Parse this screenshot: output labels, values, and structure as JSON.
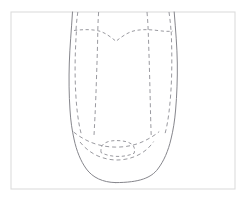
{
  "figure": {
    "background_color": "#ffffff",
    "canvas": {
      "width": 246,
      "height": 201
    }
  },
  "frame": {
    "name": "image-border-frame",
    "x": 11,
    "y": 12,
    "width": 224,
    "height": 177,
    "stroke_color": "#dcdcdc",
    "stroke_width": 1.1,
    "fill_color": "#ffffff"
  },
  "style": {
    "solid_stroke_color": "#86868c",
    "solid_stroke_width": 1.0,
    "dashed_stroke_color": "#9a9aa0",
    "dashed_stroke_width": 1.0,
    "dash_pattern": "4,3",
    "dash_pattern_fine": "3.2,2.6"
  },
  "paths": {
    "outer_contour_left": {
      "name": "vamp-outer-contour-left",
      "d": "M 72.5 12 C 71.4 30 69.8 47 69.3 63 C 68.8 79 69.0 95 70.0 110 C 70.7 121 72.0 130 74.0 139 C 76.6 151 80.6 161 86.4 169 C 92.6 177.5 102.8 182.4 115.5 182.6",
      "type": "solid"
    },
    "outer_contour_right": {
      "name": "vamp-outer-contour-right",
      "d": "M 174.2 12 C 175.6 30 177.1 47 177.3 63 C 177.5 79 176.9 95 175.6 110 C 174.7 121 173.2 130 171.0 139 C 168.2 151 163.9 161 157.8 169 C 151.4 177.5 140.0 182.6 115.5 182.6",
      "type": "solid"
    },
    "throat_curve": {
      "name": "throat-seam-curve",
      "d": "M 74.0 30.5 C 82 29.5 90 29.2 97.5 30.6 C 105 32.1 111 37.4 116 41.2 C 121 37.4 127.5 32.1 135 30.6 C 142.5 29.2 150 29.5 158.5 30.6 C 163.5 31.3 168 31.6 172.8 31.1",
      "type": "dashed"
    },
    "quarter_line_left_outer": {
      "name": "quarter-seam-left-outer",
      "d": "M 77.8 12 C 77.0 18 76.3 24 76.0 30.4",
      "type": "dashed"
    },
    "quarter_line_right_outer": {
      "name": "quarter-seam-right-outer",
      "d": "M 169.0 12 C 169.8 18 170.6 24 171.0 30.8",
      "type": "dashed"
    },
    "side_panel_left": {
      "name": "side-panel-seam-left",
      "d": "M 76.4 31.5 C 75.6 44 75.0 58 75.1 72 C 75.2 86 75.9 100 77.3 112 C 78.3 120.5 79.6 128 81.4 134.5",
      "type": "dashed"
    },
    "side_panel_right": {
      "name": "side-panel-seam-right",
      "d": "M 171.2 31.5 C 171.7 44 172.0 58 171.7 72 C 171.4 86 170.5 100 169.0 112 C 168.0 120.5 166.6 128 164.8 134.5",
      "type": "dashed"
    },
    "vamp_center_left": {
      "name": "vamp-center-seam-left",
      "d": "M 98.6 12 C 98.2 19 97.9 25 97.8 31.0 C 97.6 45 97.1 60 96.6 75 C 96.1 90 95.6 104 95.0 116 C 94.6 124 94.3 130 94.0 135.5",
      "type": "dashed"
    },
    "vamp_center_right": {
      "name": "vamp-center-seam-right",
      "d": "M 147.0 12 C 147.6 19 148.0 25 148.2 31.0 C 148.7 45 149.2 60 149.6 75 C 150.0 90 150.3 104 150.6 116 C 150.8 124 151.0 130 151.2 135.5",
      "type": "dashed"
    },
    "toe_cap_outer": {
      "name": "toe-cap-seam-outer",
      "d": "M 73.6 132.0 C 78 135.6 83 138.6 88 141.0 C 96 144.8 105.5 147.0 115.8 147.1 C 126.2 147.2 136.0 145.0 144.2 141.0 C 149.4 138.5 154.6 135.4 159.2 131.6",
      "type": "dashed"
    },
    "toe_cap_inner": {
      "name": "toe-cap-seam-inner",
      "d": "M 80.0 142.0 C 85 148.2 91 153.0 98 156.0 C 104.5 158.8 111 160.0 117.0 160.0 C 123.5 160.0 130.5 158.6 137.0 155.6 C 143.8 152.5 149.4 147.8 153.6 141.6",
      "type": "dashed"
    },
    "toe_box_detail": {
      "name": "toe-box-detail-shape",
      "d": "M 101.0 152.5 C 100.6 148.4 101.6 145.0 104.6 143.2 C 108.0 141.1 113.0 140.4 118.0 140.6 C 123.5 140.8 128.6 141.8 131.8 144.2 C 134.4 146.2 135.0 149.4 134.2 153.2 C 129.0 155.6 123.0 156.6 117.0 156.4 C 110.8 156.2 105.4 154.9 101.0 152.5 Z",
      "type": "dashed"
    }
  },
  "annotations": {
    "has_text_labels": false,
    "has_legend": false,
    "has_axes": false
  }
}
